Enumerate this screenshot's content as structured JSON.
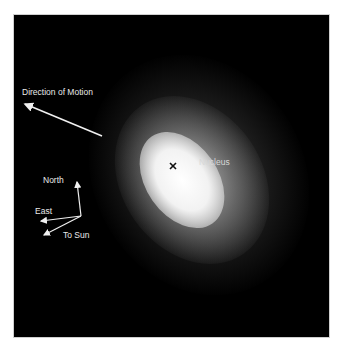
{
  "figure": {
    "background_color": "#000000",
    "frame_color": "#ffffff"
  },
  "annotations": {
    "direction_of_motion": "Direction of Motion",
    "nucleus": "Nucleus",
    "nucleus_marker": "×",
    "compass": {
      "north": "North",
      "east": "East",
      "to_sun": "To Sun"
    }
  },
  "colors": {
    "annotation_text": "#eaeaea",
    "arrow": "#f0f0f0",
    "marker": "#111111",
    "coma_core": "#ffffff"
  }
}
